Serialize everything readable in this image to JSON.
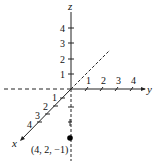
{
  "diagram": {
    "type": "3d-coordinate-axes",
    "axes": {
      "x": {
        "label": "x",
        "ticks": [
          "1",
          "2",
          "3",
          "4"
        ]
      },
      "y": {
        "label": "y",
        "ticks": [
          "1",
          "2",
          "3",
          "4"
        ]
      },
      "z": {
        "label": "z",
        "ticks": [
          "1",
          "2",
          "3",
          "4"
        ]
      }
    },
    "point": {
      "label": "(4, 2, −1)",
      "coords": [
        4,
        2,
        -1
      ]
    },
    "colors": {
      "axis": "#222222",
      "point": "#000000"
    }
  }
}
